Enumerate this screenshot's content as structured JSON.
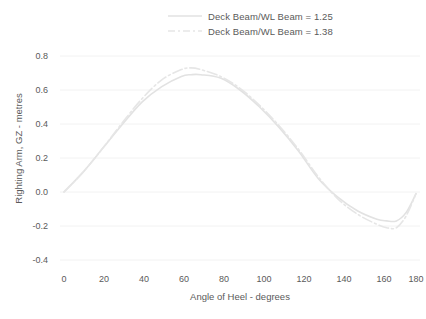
{
  "chart_data": {
    "type": "line",
    "title": "",
    "xlabel": "Angle of Heel - degrees",
    "ylabel": "Righting Arm, GZ - metres",
    "xlim": [
      0,
      180
    ],
    "ylim": [
      -0.4,
      0.8
    ],
    "xticks": [
      "0",
      "20",
      "40",
      "60",
      "80",
      "100",
      "120",
      "140",
      "160",
      "180"
    ],
    "yticks": [
      "0.8",
      "0.6",
      "0.4",
      "0.2",
      "0.0",
      "-0.2",
      "-0.4"
    ],
    "grid": true,
    "grid_color": "#f2f2f2",
    "legend_position": "top-center",
    "x": [
      0,
      10,
      20,
      30,
      40,
      50,
      60,
      65,
      70,
      80,
      90,
      100,
      110,
      120,
      130,
      140,
      150,
      160,
      165,
      170,
      175,
      180
    ],
    "series": [
      {
        "name": "Deck Beam/WL Beam = 1.25",
        "label": "Deck Beam/WL Beam = 1.25",
        "color": "#e2e2e2",
        "style": "solid",
        "values": [
          0.0,
          0.12,
          0.26,
          0.4,
          0.53,
          0.62,
          0.68,
          0.69,
          0.69,
          0.67,
          0.6,
          0.5,
          0.38,
          0.24,
          0.08,
          -0.03,
          -0.11,
          -0.16,
          -0.17,
          -0.17,
          -0.12,
          -0.01
        ]
      },
      {
        "name": "Deck Beam/WL Beam = 1.38",
        "label": "Deck Beam/WL Beam = 1.38",
        "color": "#e6e6e6",
        "style": "dashdot",
        "values": [
          0.0,
          0.12,
          0.26,
          0.41,
          0.55,
          0.66,
          0.72,
          0.73,
          0.72,
          0.68,
          0.61,
          0.51,
          0.39,
          0.25,
          0.09,
          -0.04,
          -0.13,
          -0.19,
          -0.21,
          -0.21,
          -0.14,
          -0.01
        ]
      }
    ]
  },
  "legend": {
    "entries": [
      {
        "label": "Deck Beam/WL Beam = 1.25"
      },
      {
        "label": "Deck Beam/WL Beam = 1.38"
      }
    ]
  },
  "axes": {
    "y_title": "Righting Arm, GZ - metres",
    "x_title": "Angle of Heel - degrees",
    "y_ticks": [
      {
        "label": "0.8"
      },
      {
        "label": "0.6"
      },
      {
        "label": "0.4"
      },
      {
        "label": "0.2"
      },
      {
        "label": "0.0"
      },
      {
        "label": "-0.2"
      },
      {
        "label": "-0.4"
      }
    ],
    "x_ticks": [
      {
        "label": "0"
      },
      {
        "label": "20"
      },
      {
        "label": "40"
      },
      {
        "label": "60"
      },
      {
        "label": "80"
      },
      {
        "label": "100"
      },
      {
        "label": "120"
      },
      {
        "label": "140"
      },
      {
        "label": "160"
      },
      {
        "label": "180"
      }
    ]
  }
}
